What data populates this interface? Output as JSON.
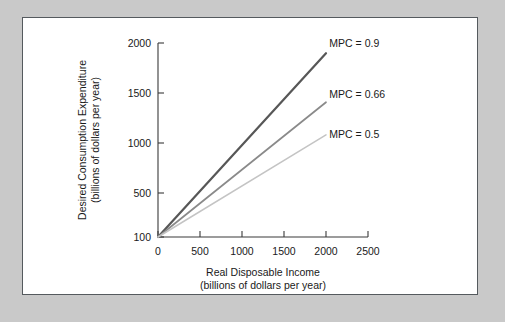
{
  "figure": {
    "background_color": "#c9c9c9",
    "panel_color": "#ffffff",
    "panel_border_color": "#555a5e"
  },
  "chart_data": {
    "type": "line",
    "title": "",
    "xlabel": "Real Disposable Income",
    "xlabel_sub": "(billions of dollars per year)",
    "ylabel": "Desired Consumption Expenditure",
    "ylabel_sub": "(billions of dollars per year)",
    "xlim": [
      0,
      2500
    ],
    "ylim": [
      100,
      2000
    ],
    "xticks": [
      0,
      500,
      1000,
      1500,
      2000,
      2500
    ],
    "xtick_labels": [
      "0",
      "500",
      "1000",
      "1500",
      "2000",
      "2500"
    ],
    "yticks": [
      100,
      500,
      1000,
      1500,
      2000
    ],
    "ytick_labels": [
      "100",
      "500",
      "1000",
      "1500",
      "2000"
    ],
    "grid": false,
    "legend_position": "inline-right",
    "series": [
      {
        "name": "MPC = 0.9",
        "label": "MPC = 0.9",
        "mpc": 0.9,
        "intercept": 100,
        "color": "#575757",
        "x": [
          0,
          2000
        ],
        "values": [
          100,
          1900
        ],
        "label_x": 2040,
        "label_y": 2000
      },
      {
        "name": "MPC = 0.66",
        "label": "MPC = 0.66",
        "mpc": 0.66,
        "intercept": 100,
        "color": "#8a8a8a",
        "x": [
          0,
          2000
        ],
        "values": [
          100,
          1420
        ],
        "label_x": 2040,
        "label_y": 1500
      },
      {
        "name": "MPC = 0.5",
        "label": "MPC = 0.5",
        "mpc": 0.5,
        "intercept": 100,
        "color": "#c4c4c4",
        "x": [
          0,
          2000
        ],
        "values": [
          100,
          1100
        ],
        "label_x": 2040,
        "label_y": 1110
      }
    ]
  }
}
